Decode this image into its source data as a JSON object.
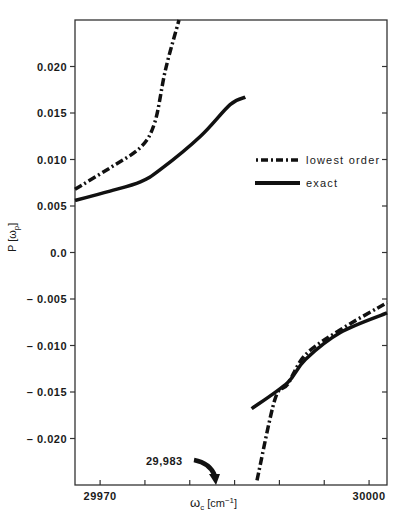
{
  "chart_data": {
    "type": "line",
    "title": "",
    "xlabel": "ωc [cm⁻¹]",
    "ylabel": "P [ωp]",
    "xlim": [
      29967.2,
      30002.0
    ],
    "ylim": [
      -0.025,
      0.025
    ],
    "grid": false,
    "legend_position": "center-right",
    "x_ticks": [
      29970,
      29975,
      29980,
      29985,
      29990,
      29995,
      30000
    ],
    "x_tick_labels": [
      "29970",
      "",
      "",
      "",
      "",
      "",
      "30000"
    ],
    "y_ticks": [
      0.02,
      0.015,
      0.01,
      0.005,
      0.0,
      -0.005,
      -0.01,
      -0.015,
      -0.02
    ],
    "y_tick_labels": [
      "0.020",
      "0.015",
      "0.010",
      "0.005",
      "0.0",
      "– 0.005",
      "– 0.010",
      "– 0.015",
      "– 0.020"
    ],
    "series": [
      {
        "name": "lowest order",
        "style": "dash-dot",
        "segments": [
          {
            "x": [
              29967.2,
              29971.1,
              29974.5,
              29976.1,
              29977.3,
              29978.8
            ],
            "y": [
              0.0068,
              0.0091,
              0.0113,
              0.014,
              0.0197,
              0.025
            ]
          },
          {
            "x": [
              29987.5,
              29989.5,
              29990.9,
              29992.9,
              29996.8,
              30002.0
            ],
            "y": [
              -0.0245,
              -0.0158,
              -0.0142,
              -0.011,
              -0.0083,
              -0.0054
            ]
          }
        ]
      },
      {
        "name": "exact",
        "style": "solid",
        "segments": [
          {
            "x": [
              29967.2,
              29971.1,
              29974.5,
              29976.7,
              29981.2,
              29984.5,
              29986.2
            ],
            "y": [
              0.0056,
              0.0066,
              0.0076,
              0.0089,
              0.0125,
              0.0159,
              0.0167
            ]
          },
          {
            "x": [
              29986.9,
              29990.9,
              29992.9,
              29996.8,
              30002.0
            ],
            "y": [
              -0.0168,
              -0.014,
              -0.0115,
              -0.0086,
              -0.0065
            ]
          }
        ]
      }
    ],
    "annotations": [
      {
        "text": "29,983",
        "arrow_to_x": 29983,
        "arrow_to_y": -0.025
      }
    ]
  },
  "legend": {
    "items": [
      {
        "label": "lowest order",
        "style": "dash-dot"
      },
      {
        "label": "exact",
        "style": "solid"
      }
    ]
  },
  "axes": {
    "xlabel_main": "ω",
    "xlabel_sub": "c",
    "xlabel_unit": " [cm",
    "xlabel_sup": "−1",
    "xlabel_close": "]",
    "ylabel_main": "P [ω",
    "ylabel_sub": "p",
    "ylabel_close": "]"
  },
  "annotation": {
    "text": "29,983"
  }
}
